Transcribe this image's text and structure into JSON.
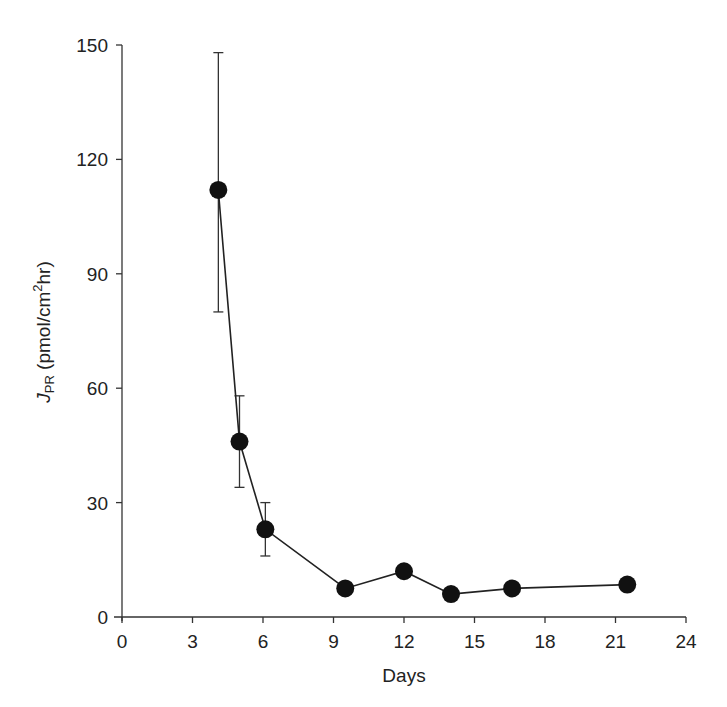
{
  "chart_data": {
    "type": "line",
    "title": "",
    "xlabel": "Days",
    "ylabel": "J_PR (pmol/cm²hr)",
    "ylabel_parts": {
      "symbol": "J",
      "subscript": "PR",
      "unit_pre": " (pmol/cm",
      "superscript": "2",
      "unit_post": "hr)"
    },
    "xlim": [
      0,
      24
    ],
    "ylim": [
      0,
      150
    ],
    "x_ticks": [
      0,
      3,
      6,
      9,
      12,
      15,
      18,
      21,
      24
    ],
    "y_ticks": [
      0,
      30,
      60,
      90,
      120,
      150
    ],
    "grid": false,
    "legend": null,
    "series": [
      {
        "name": "J_PR",
        "marker": "filled-circle",
        "color": "#111111",
        "x": [
          4.1,
          5.0,
          6.1,
          9.5,
          12.0,
          14.0,
          16.6,
          21.5
        ],
        "y": [
          112,
          46,
          23,
          7.5,
          12,
          6,
          7.5,
          8.5
        ],
        "error_low": [
          80,
          34,
          16,
          null,
          null,
          null,
          null,
          null
        ],
        "error_high": [
          148,
          58,
          30,
          null,
          null,
          null,
          null,
          null
        ]
      }
    ]
  }
}
